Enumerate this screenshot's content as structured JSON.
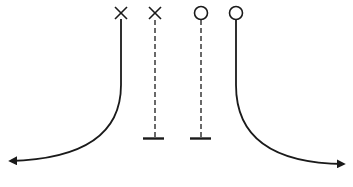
{
  "diagram": {
    "type": "play-diagram",
    "colors": {
      "ink": "#1a1a1a",
      "background": "#ffffff"
    },
    "players": [
      {
        "id": "x1",
        "marker": "x-icon",
        "label": "X",
        "x": 121,
        "y": 13
      },
      {
        "id": "x2",
        "marker": "x-icon",
        "label": "X",
        "x": 155,
        "y": 13
      },
      {
        "id": "o1",
        "marker": "circle-icon",
        "label": "O",
        "x": 201,
        "y": 13
      },
      {
        "id": "o2",
        "marker": "circle-icon",
        "label": "O",
        "x": 236,
        "y": 13
      }
    ],
    "routes": [
      {
        "from": "x1",
        "style": "solid",
        "end": "arrow-left",
        "path": "curve-down-left"
      },
      {
        "from": "x2",
        "style": "dashed",
        "end": "block-t",
        "path": "straight-down"
      },
      {
        "from": "o1",
        "style": "dashed",
        "end": "block-t",
        "path": "straight-down"
      },
      {
        "from": "o2",
        "style": "solid",
        "end": "arrow-right",
        "path": "curve-down-right"
      }
    ]
  }
}
